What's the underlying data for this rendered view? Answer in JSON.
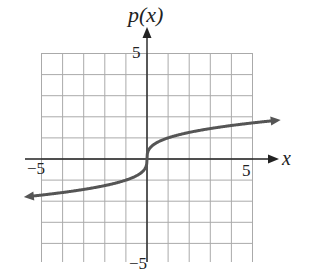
{
  "chart_data": {
    "type": "line",
    "title": "",
    "xlabel": "x",
    "ylabel": "p(x)",
    "function": "p(x) = cube root of x",
    "x": [
      -6,
      -5,
      -4,
      -3,
      -2,
      -1,
      -0.5,
      -0.1,
      0,
      0.1,
      0.5,
      1,
      2,
      3,
      4,
      5,
      6
    ],
    "series": [
      {
        "name": "p(x)",
        "values": [
          -1.82,
          -1.71,
          -1.59,
          -1.44,
          -1.26,
          -1.0,
          -0.79,
          -0.46,
          0,
          0.46,
          0.79,
          1.0,
          1.26,
          1.44,
          1.59,
          1.71,
          1.82
        ]
      }
    ],
    "tick_labels": {
      "x": [
        "-5",
        "5"
      ],
      "y": [
        "5",
        "-5"
      ]
    },
    "xlim": [
      -5,
      5
    ],
    "ylim": [
      -5,
      5
    ],
    "grid": true,
    "arrows": {
      "curve_left": true,
      "curve_right": true,
      "x_axis": true,
      "y_axis": true
    },
    "colors": {
      "curve": "#555555",
      "axis": "#222222",
      "grid": "#aaaaaa"
    }
  },
  "labels": {
    "y_axis": "p(x)",
    "x_axis": "x",
    "x_min": "−5",
    "x_max": "5",
    "y_max": "5",
    "y_min": "−5"
  }
}
